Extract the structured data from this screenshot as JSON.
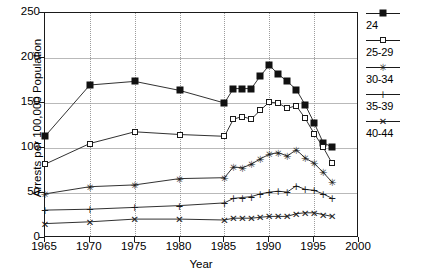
{
  "chart_data": {
    "type": "line",
    "title": "",
    "xlabel": "Year",
    "ylabel": "Arrests per 100,000 Population",
    "xlim": [
      1965,
      2000
    ],
    "ylim": [
      0,
      250
    ],
    "xticks": [
      1965,
      1970,
      1975,
      1980,
      1985,
      1990,
      1995,
      2000
    ],
    "yticks": [
      0,
      50,
      100,
      150,
      200,
      250
    ],
    "grid": true,
    "legend_position": "right",
    "series": [
      {
        "name": "24",
        "marker": "filled-square",
        "x": [
          1965,
          1970,
          1975,
          1980,
          1985,
          1986,
          1987,
          1988,
          1989,
          1990,
          1991,
          1992,
          1993,
          1994,
          1995,
          1996,
          1997
        ],
        "values": [
          113,
          170,
          174,
          164,
          150,
          166,
          166,
          166,
          180,
          192,
          182,
          174,
          165,
          148,
          128,
          106,
          101
        ]
      },
      {
        "name": "25-29",
        "marker": "open-square",
        "x": [
          1965,
          1970,
          1975,
          1980,
          1985,
          1986,
          1987,
          1988,
          1989,
          1990,
          1991,
          1992,
          1993,
          1994,
          1995,
          1996,
          1997
        ],
        "values": [
          82,
          105,
          118,
          115,
          113,
          132,
          135,
          132,
          142,
          151,
          150,
          144,
          147,
          133,
          116,
          101,
          83
        ]
      },
      {
        "name": "30-34",
        "marker": "star",
        "x": [
          1965,
          1970,
          1975,
          1980,
          1985,
          1986,
          1987,
          1988,
          1989,
          1990,
          1991,
          1992,
          1993,
          1994,
          1995,
          1996,
          1997
        ],
        "values": [
          49,
          57,
          59,
          66,
          67,
          79,
          78,
          82,
          88,
          93,
          95,
          91,
          98,
          89,
          83,
          73,
          62
        ]
      },
      {
        "name": "35-39",
        "marker": "plus",
        "x": [
          1965,
          1970,
          1975,
          1980,
          1985,
          1986,
          1987,
          1988,
          1989,
          1990,
          1991,
          1992,
          1993,
          1994,
          1995,
          1996,
          1997
        ],
        "values": [
          31,
          32,
          34,
          36,
          39,
          44,
          45,
          46,
          49,
          51,
          52,
          51,
          58,
          54,
          53,
          49,
          44
        ]
      },
      {
        "name": "40-44",
        "marker": "x",
        "x": [
          1965,
          1970,
          1975,
          1980,
          1985,
          1986,
          1987,
          1988,
          1989,
          1990,
          1991,
          1992,
          1993,
          1994,
          1995,
          1996,
          1997
        ],
        "values": [
          16,
          18,
          21,
          21,
          20,
          22,
          22,
          22,
          23,
          24,
          24,
          24,
          27,
          28,
          28,
          26,
          24
        ]
      }
    ]
  },
  "legend": {
    "entries": [
      {
        "label": "24",
        "marker": "filled-square"
      },
      {
        "label": "25-29",
        "marker": "open-square"
      },
      {
        "label": "30-34",
        "marker": "star"
      },
      {
        "label": "35-39",
        "marker": "plus"
      },
      {
        "label": "40-44",
        "marker": "x"
      }
    ]
  },
  "axes": {
    "xlabel": "Year",
    "ylabel": "Arrests per 100,000 Population",
    "xticks": [
      "1965",
      "1970",
      "1975",
      "1980",
      "1985",
      "1990",
      "1995",
      "2000"
    ],
    "yticks": [
      "0",
      "50",
      "100",
      "150",
      "200",
      "250"
    ]
  }
}
